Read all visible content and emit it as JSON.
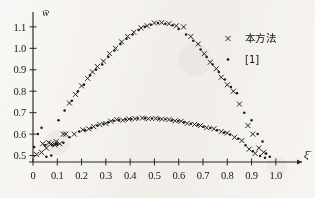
{
  "chart_data": {
    "type": "scatter",
    "title": "",
    "xlabel": "ξ̄",
    "ylabel": "w̄",
    "xlim": [
      0,
      1.05
    ],
    "ylim": [
      0.47,
      1.16
    ],
    "grid": false,
    "legend_position": "top-right",
    "xticks": [
      "0",
      "0.1",
      "0.2",
      "0.3",
      "0.4",
      "0.5",
      "0.6",
      "0.7",
      "0.8",
      "0.9",
      "1.0"
    ],
    "xtick_values": [
      0,
      0.1,
      0.2,
      0.3,
      0.4,
      0.5,
      0.6,
      0.7,
      0.8,
      0.9,
      1.0
    ],
    "yticks": [
      "0.5",
      "0.6",
      "0.7",
      "0.8",
      "0.9",
      "1.0",
      "1.1"
    ],
    "ytick_values": [
      0.5,
      0.6,
      0.7,
      0.8,
      0.9,
      1.0,
      1.1
    ],
    "series": [
      {
        "name": "本方法",
        "marker": "x",
        "color": "#1c1a16",
        "points": [
          [
            0.015,
            0.505
          ],
          [
            0.035,
            0.515
          ],
          [
            0.055,
            0.535
          ],
          [
            0.075,
            0.555
          ],
          [
            0.095,
            0.565
          ],
          [
            0.125,
            0.6
          ],
          [
            0.15,
            0.745
          ],
          [
            0.175,
            0.785
          ],
          [
            0.2,
            0.825
          ],
          [
            0.225,
            0.86
          ],
          [
            0.245,
            0.89
          ],
          [
            0.265,
            0.915
          ],
          [
            0.29,
            0.94
          ],
          [
            0.315,
            0.975
          ],
          [
            0.34,
            1.0
          ],
          [
            0.365,
            1.03
          ],
          [
            0.39,
            1.055
          ],
          [
            0.415,
            1.075
          ],
          [
            0.445,
            1.095
          ],
          [
            0.47,
            1.105
          ],
          [
            0.5,
            1.118
          ],
          [
            0.53,
            1.12
          ],
          [
            0.56,
            1.115
          ],
          [
            0.59,
            1.105
          ],
          [
            0.62,
            1.1
          ],
          [
            0.65,
            1.055
          ],
          [
            0.68,
            1.02
          ],
          [
            0.705,
            0.975
          ],
          [
            0.73,
            0.935
          ],
          [
            0.755,
            0.905
          ],
          [
            0.775,
            0.865
          ],
          [
            0.8,
            0.83
          ],
          [
            0.825,
            0.8
          ],
          [
            0.85,
            0.74
          ],
          [
            0.885,
            0.64
          ],
          [
            0.905,
            0.6
          ],
          [
            0.93,
            0.535
          ],
          [
            0.95,
            0.515
          ]
        ]
      },
      {
        "name": "[1]",
        "marker": "dot",
        "color": "#1c1a16",
        "points": [
          [
            0.005,
            0.54
          ],
          [
            0.02,
            0.6
          ],
          [
            0.035,
            0.63
          ],
          [
            0.055,
            0.495
          ],
          [
            0.075,
            0.5
          ],
          [
            0.095,
            0.555
          ],
          [
            0.105,
            0.665
          ],
          [
            0.13,
            0.71
          ],
          [
            0.16,
            0.755
          ],
          [
            0.185,
            0.8
          ],
          [
            0.21,
            0.83
          ],
          [
            0.235,
            0.875
          ],
          [
            0.26,
            0.9
          ],
          [
            0.285,
            0.925
          ],
          [
            0.31,
            0.96
          ],
          [
            0.335,
            0.99
          ],
          [
            0.36,
            1.02
          ],
          [
            0.385,
            1.045
          ],
          [
            0.41,
            1.065
          ],
          [
            0.435,
            1.085
          ],
          [
            0.46,
            1.1
          ],
          [
            0.485,
            1.11
          ],
          [
            0.515,
            1.118
          ],
          [
            0.545,
            1.115
          ],
          [
            0.575,
            1.108
          ],
          [
            0.6,
            1.09
          ],
          [
            0.63,
            1.065
          ],
          [
            0.66,
            1.035
          ],
          [
            0.69,
            0.995
          ],
          [
            0.715,
            0.96
          ],
          [
            0.74,
            0.925
          ],
          [
            0.765,
            0.89
          ],
          [
            0.79,
            0.855
          ],
          [
            0.815,
            0.82
          ],
          [
            0.84,
            0.79
          ],
          [
            0.87,
            0.7
          ],
          [
            0.9,
            0.665
          ],
          [
            0.925,
            0.6
          ],
          [
            0.945,
            0.565
          ],
          [
            0.96,
            0.51
          ],
          [
            0.975,
            0.495
          ]
        ]
      },
      {
        "name": "本方法",
        "marker": "x",
        "color": "#1c1a16",
        "series_group": "lower",
        "points": [
          [
            0.04,
            0.555
          ],
          [
            0.065,
            0.56
          ],
          [
            0.09,
            0.55
          ],
          [
            0.11,
            0.555
          ],
          [
            0.135,
            0.6
          ],
          [
            0.17,
            0.6
          ],
          [
            0.205,
            0.62
          ],
          [
            0.23,
            0.625
          ],
          [
            0.25,
            0.635
          ],
          [
            0.275,
            0.645
          ],
          [
            0.3,
            0.65
          ],
          [
            0.32,
            0.66
          ],
          [
            0.345,
            0.668
          ],
          [
            0.37,
            0.665
          ],
          [
            0.395,
            0.67
          ],
          [
            0.42,
            0.672
          ],
          [
            0.45,
            0.675
          ],
          [
            0.475,
            0.672
          ],
          [
            0.505,
            0.673
          ],
          [
            0.53,
            0.67
          ],
          [
            0.56,
            0.668
          ],
          [
            0.585,
            0.662
          ],
          [
            0.61,
            0.66
          ],
          [
            0.635,
            0.65
          ],
          [
            0.665,
            0.645
          ],
          [
            0.69,
            0.64
          ],
          [
            0.715,
            0.63
          ],
          [
            0.745,
            0.625
          ],
          [
            0.775,
            0.612
          ],
          [
            0.8,
            0.605
          ],
          [
            0.83,
            0.585
          ],
          [
            0.86,
            0.57
          ],
          [
            0.89,
            0.53
          ],
          [
            0.915,
            0.51
          ]
        ]
      },
      {
        "name": "[1]",
        "marker": "dot",
        "color": "#1c1a16",
        "series_group": "lower",
        "points": [
          [
            0.05,
            0.548
          ],
          [
            0.08,
            0.548
          ],
          [
            0.1,
            0.552
          ],
          [
            0.125,
            0.56
          ],
          [
            0.15,
            0.585
          ],
          [
            0.19,
            0.612
          ],
          [
            0.215,
            0.618
          ],
          [
            0.24,
            0.628
          ],
          [
            0.265,
            0.64
          ],
          [
            0.29,
            0.648
          ],
          [
            0.31,
            0.655
          ],
          [
            0.332,
            0.662
          ],
          [
            0.355,
            0.666
          ],
          [
            0.382,
            0.668
          ],
          [
            0.405,
            0.67
          ],
          [
            0.432,
            0.673
          ],
          [
            0.462,
            0.674
          ],
          [
            0.49,
            0.673
          ],
          [
            0.518,
            0.672
          ],
          [
            0.545,
            0.669
          ],
          [
            0.572,
            0.665
          ],
          [
            0.598,
            0.661
          ],
          [
            0.622,
            0.655
          ],
          [
            0.65,
            0.648
          ],
          [
            0.678,
            0.642
          ],
          [
            0.702,
            0.634
          ],
          [
            0.73,
            0.628
          ],
          [
            0.758,
            0.618
          ],
          [
            0.788,
            0.608
          ],
          [
            0.812,
            0.598
          ],
          [
            0.845,
            0.578
          ],
          [
            0.875,
            0.548
          ],
          [
            0.905,
            0.52
          ],
          [
            0.935,
            0.498
          ],
          [
            0.955,
            0.49
          ]
        ]
      }
    ],
    "legend_entries": [
      {
        "marker": "x",
        "label": "本方法"
      },
      {
        "marker": "dot",
        "label": "[1]"
      }
    ]
  }
}
